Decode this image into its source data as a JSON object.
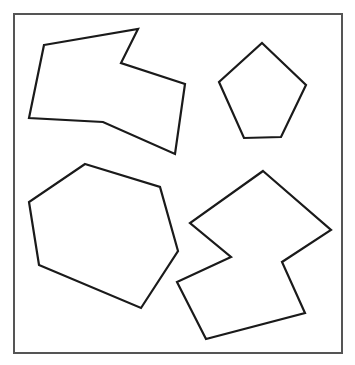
{
  "canvas": {
    "width": 355,
    "height": 365,
    "background": "#ffffff"
  },
  "frame": {
    "x": 14,
    "y": 14,
    "width": 328,
    "height": 339,
    "stroke": "#555555",
    "stroke_width": 2
  },
  "shapes": [
    {
      "name": "irregular-heptagon-top-left",
      "points": "44,45 138,29 121,63 185,84 175,154 103,122 29,118",
      "stroke": "#1a1a1a"
    },
    {
      "name": "pentagon-top-right",
      "points": "262,43 306,85 281,137 244,138 219,82",
      "stroke": "#1a1a1a"
    },
    {
      "name": "hexagon-bottom-left",
      "points": "85,164 160,187 178,251 141,308 39,265 29,202",
      "stroke": "#1a1a1a"
    },
    {
      "name": "zigzag-octagon-bottom-right",
      "points": "263,171 331,230 282,262 305,313 206,339 177,282 231,257 190,223",
      "stroke": "#1a1a1a"
    }
  ]
}
